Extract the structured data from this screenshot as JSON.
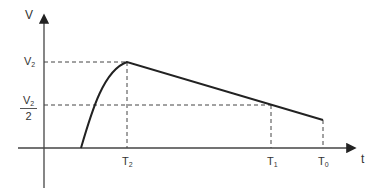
{
  "diagram": {
    "y_axis_label": "V",
    "x_axis_label": "t",
    "v_levels": [
      {
        "main": "V",
        "sub": "2"
      },
      {
        "num_main": "V",
        "num_sub": "2",
        "den": "2"
      }
    ],
    "t_ticks": [
      {
        "main": "T",
        "sub": "2"
      },
      {
        "main": "T",
        "sub": "1"
      },
      {
        "main": "T",
        "sub": "0"
      }
    ],
    "colors": {
      "curve": "#222222",
      "axis": "#444444",
      "dashed": "#444444"
    }
  }
}
